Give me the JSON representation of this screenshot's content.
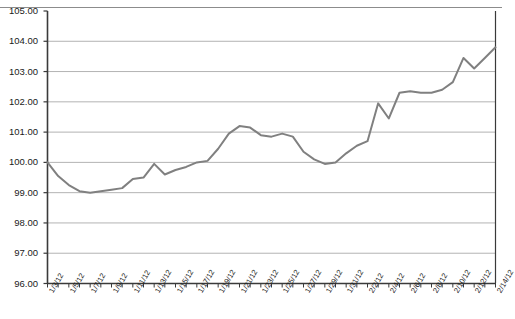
{
  "chart_data": {
    "type": "line",
    "title": "",
    "xlabel": "",
    "ylabel": "",
    "ylim": [
      96.0,
      105.0
    ],
    "ytick_step": 1.0,
    "yticks": [
      "96.00",
      "97.00",
      "98.00",
      "99.00",
      "100.00",
      "101.00",
      "102.00",
      "103.00",
      "104.00",
      "105.00"
    ],
    "grid": true,
    "grid_axis": "y",
    "legend": false,
    "legend_position": "none",
    "line_color": "#808080",
    "line_width": 2,
    "axis_color": "#3a3a3a",
    "grid_color": "#b3b3b3",
    "x": [
      "1/3/12",
      "1/4/12",
      "1/5/12",
      "1/6/12",
      "1/7/12",
      "1/8/12",
      "1/9/12",
      "1/10/12",
      "1/11/12",
      "1/12/12",
      "1/13/12",
      "1/14/12",
      "1/15/12",
      "1/16/12",
      "1/17/12",
      "1/18/12",
      "1/19/12",
      "1/20/12",
      "1/21/12",
      "1/22/12",
      "1/23/12",
      "1/24/12",
      "1/25/12",
      "1/26/12",
      "1/27/12",
      "1/28/12",
      "1/29/12",
      "1/30/12",
      "1/31/12",
      "2/1/12",
      "2/2/12",
      "2/3/12",
      "2/4/12",
      "2/5/12",
      "2/6/12",
      "2/7/12",
      "2/8/12",
      "2/9/12",
      "2/10/12",
      "2/11/12",
      "2/12/12",
      "2/13/12",
      "2/14/12"
    ],
    "xtick_labels": [
      "1/3/12",
      "1/5/12",
      "1/7/12",
      "1/9/12",
      "1/11/12",
      "1/13/12",
      "1/15/12",
      "1/17/12",
      "1/19/12",
      "1/21/12",
      "1/23/12",
      "1/25/12",
      "1/27/12",
      "1/29/12",
      "1/31/12",
      "2/2/12",
      "2/4/12",
      "2/6/12",
      "2/8/12",
      "2/10/12",
      "2/12/12",
      "2/14/12"
    ],
    "xtick_label_every": 2,
    "series": [
      {
        "name": "Index",
        "values": [
          100.0,
          99.55,
          99.25,
          99.05,
          99.0,
          99.05,
          99.1,
          99.15,
          99.45,
          99.5,
          99.95,
          99.6,
          99.75,
          99.85,
          100.0,
          100.05,
          100.45,
          100.95,
          101.2,
          101.15,
          100.9,
          100.85,
          100.95,
          100.85,
          100.35,
          100.1,
          99.95,
          100.0,
          100.3,
          100.55,
          100.7,
          101.95,
          101.45,
          102.3,
          102.35,
          102.3,
          102.3,
          102.4,
          102.65,
          103.45,
          103.1,
          103.45,
          103.8
        ]
      }
    ]
  },
  "axes": {
    "y_min_label": "96.00",
    "y_max_label": "105.00"
  }
}
